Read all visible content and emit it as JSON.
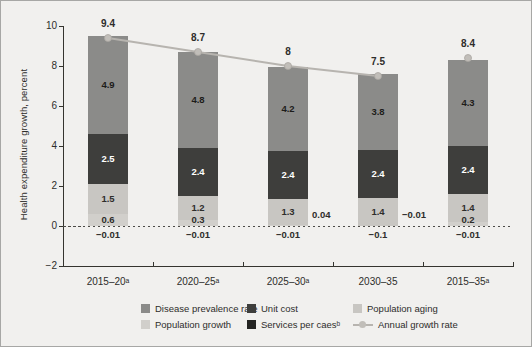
{
  "figure": {
    "background": "#f1f0ee",
    "border_color": "#a7a7a5",
    "text_color": "#2e2d2b"
  },
  "chart_data": {
    "type": "bar",
    "stacked": true,
    "title": "",
    "xlabel": "",
    "ylabel": "Health expenditure growth, percent",
    "ylim": [
      -2,
      10
    ],
    "grid": false,
    "legend_position": "bottom",
    "yticks": [
      {
        "v": 10,
        "label": "10"
      },
      {
        "v": 8,
        "label": "8"
      },
      {
        "v": 6,
        "label": "6"
      },
      {
        "v": 4,
        "label": "4"
      },
      {
        "v": 2,
        "label": "2"
      },
      {
        "v": 0,
        "label": "0"
      },
      {
        "v": -2,
        "label": "−2"
      }
    ],
    "categories": [
      "2015–20ᵃ",
      "2020–25ᵃ",
      "2025–30ᵃ",
      "2030–35",
      "2015–35ᵃ"
    ],
    "series": [
      {
        "name": "Population growth",
        "color": "#d1cfcb",
        "values": [
          0.6,
          0.3,
          0.04,
          -0.01,
          0.2
        ],
        "value_labels": [
          "0.6",
          "0.3",
          "0.04",
          "−0.01",
          "0.2"
        ],
        "label_placement": [
          "inside",
          "inside",
          "right",
          "right",
          "inside"
        ],
        "text_color": "#2e2d2b"
      },
      {
        "name": "Population aging",
        "color": "#c8c6c2",
        "values": [
          1.5,
          1.2,
          1.3,
          1.4,
          1.4
        ],
        "value_labels": [
          "1.5",
          "1.2",
          "1.3",
          "1.4",
          "1.4"
        ],
        "label_placement": [
          "inside",
          "inside",
          "inside",
          "inside",
          "inside"
        ],
        "text_color": "#2e2d2b"
      },
      {
        "name": "Unit cost",
        "color": "#3e3e3c",
        "values": [
          2.5,
          2.4,
          2.4,
          2.4,
          2.4
        ],
        "value_labels": [
          "2.5",
          "2.4",
          "2.4",
          "2.4",
          "2.4"
        ],
        "label_placement": [
          "inside",
          "inside",
          "inside",
          "inside",
          "inside"
        ],
        "text_color": "#ffffff"
      },
      {
        "name": "Disease prevalence rate",
        "color": "#8b8b89",
        "values": [
          4.9,
          4.8,
          4.2,
          3.8,
          4.3
        ],
        "value_labels": [
          "4.9",
          "4.8",
          "4.2",
          "3.8",
          "4.3"
        ],
        "label_placement": [
          "inside",
          "inside",
          "inside",
          "inside",
          "inside"
        ],
        "text_color": "#1d1c1a"
      },
      {
        "name": "Services per caesᵇ",
        "color": "#242422",
        "values": [
          -0.01,
          -0.01,
          -0.01,
          -0.1,
          -0.01
        ],
        "value_labels": [
          "−0.01",
          "−0.01",
          "−0.01",
          "−0.1",
          "−0.01"
        ],
        "label_placement": [
          "below",
          "below",
          "below",
          "below",
          "below"
        ],
        "text_color": "#2e2d2b"
      }
    ],
    "line_series": {
      "name": "Annual growth rate",
      "color": "#b7b4af",
      "marker_fill": "#c1beb9",
      "marker_stroke": "#a9a6a1",
      "values": [
        9.4,
        8.7,
        8,
        7.5,
        8.4
      ],
      "value_labels": [
        "9.4",
        "8.7",
        "8",
        "7.5",
        "8.4"
      ],
      "connected_points": 4
    },
    "legend_order": [
      "Disease prevalence rate",
      "Unit cost",
      "Population aging",
      "Population growth",
      "Services per caesᵇ",
      "Annual growth rate"
    ]
  }
}
